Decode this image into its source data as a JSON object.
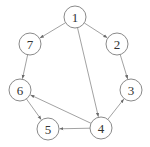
{
  "graph": {
    "type": "directed",
    "node_radius": 11,
    "stroke_color": "#8a8a8a",
    "nodes": [
      {
        "id": "1",
        "label": "1",
        "x": 75,
        "y": 17
      },
      {
        "id": "2",
        "label": "2",
        "x": 117,
        "y": 44
      },
      {
        "id": "3",
        "label": "3",
        "x": 131,
        "y": 90
      },
      {
        "id": "4",
        "label": "4",
        "x": 101,
        "y": 128
      },
      {
        "id": "5",
        "label": "5",
        "x": 48,
        "y": 129
      },
      {
        "id": "6",
        "label": "6",
        "x": 20,
        "y": 90
      },
      {
        "id": "7",
        "label": "7",
        "x": 30,
        "y": 44
      }
    ],
    "edges": [
      {
        "from": "1",
        "to": "7"
      },
      {
        "from": "1",
        "to": "2"
      },
      {
        "from": "1",
        "to": "4"
      },
      {
        "from": "2",
        "to": "3"
      },
      {
        "from": "7",
        "to": "6"
      },
      {
        "from": "4",
        "to": "3"
      },
      {
        "from": "4",
        "to": "6"
      },
      {
        "from": "4",
        "to": "5"
      },
      {
        "from": "6",
        "to": "5"
      }
    ]
  }
}
